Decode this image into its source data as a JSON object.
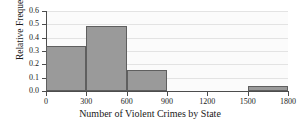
{
  "chart_data": {
    "type": "bar",
    "title": "",
    "xlabel": "Number of Violent Crimes by State",
    "ylabel": "Relative Frequency",
    "xlim": [
      0,
      1800
    ],
    "ylim": [
      0.0,
      0.6
    ],
    "xticks": [
      "0",
      "300",
      "600",
      "900",
      "1200",
      "1500",
      "1800"
    ],
    "xtick_values": [
      0,
      300,
      600,
      900,
      1200,
      1500,
      1800
    ],
    "yticks": [
      "0.0",
      "0.1",
      "0.2",
      "0.3",
      "0.4",
      "0.5",
      "0.6"
    ],
    "ytick_values": [
      0.0,
      0.1,
      0.2,
      0.3,
      0.4,
      0.5,
      0.6
    ],
    "grid": true,
    "grid_axis": "y",
    "legend": false,
    "bin_width": 300,
    "categories": [
      "0-300",
      "300-600",
      "600-900",
      "900-1200",
      "1200-1500",
      "1500-1800"
    ],
    "bin_edges": [
      0,
      300,
      600,
      900,
      1200,
      1500,
      1800
    ],
    "values": [
      0.34,
      0.49,
      0.16,
      0.0,
      0.0,
      0.04
    ],
    "bars": [
      {
        "x0": 0,
        "x1": 300,
        "value": 0.34
      },
      {
        "x0": 300,
        "x1": 600,
        "value": 0.49
      },
      {
        "x0": 600,
        "x1": 900,
        "value": 0.16
      },
      {
        "x0": 1500,
        "x1": 1800,
        "value": 0.04
      }
    ],
    "colors": {
      "bar_fill": "#9a9a9a",
      "bar_edge": "#5f5f5f",
      "axis": "#4d4d4d",
      "grid": "#e3e3e3",
      "plot_background": "#fbfbfb",
      "text": "#1a1a1a"
    }
  }
}
